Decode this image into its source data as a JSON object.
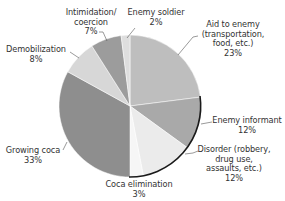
{
  "chart_data": {
    "type": "pie",
    "title": "",
    "start_angle_deg": 0,
    "direction": "clockwise",
    "slices": [
      {
        "label": "Aid to enemy (transportation, food, etc.)",
        "lines": [
          "Aid to enemy",
          "(transportation,",
          "food, etc.)"
        ],
        "value": 23,
        "pct_label": "23%",
        "color": "#bebebe"
      },
      {
        "label": "Enemy informant",
        "lines": [
          "Enemy informant"
        ],
        "value": 12,
        "pct_label": "12%",
        "color": "#a9a9a9"
      },
      {
        "label": "Disorder (robbery, drug use, assaults, etc.)",
        "lines": [
          "Disorder (robbery,",
          "drug use,",
          "assaults, etc.)"
        ],
        "value": 12,
        "pct_label": "12%",
        "color": "#ebebeb"
      },
      {
        "label": "Coca elimination",
        "lines": [
          "Coca elimination"
        ],
        "value": 3,
        "pct_label": "3%",
        "color": "#f6f6f6"
      },
      {
        "label": "Growing coca",
        "lines": [
          "Growing coca"
        ],
        "value": 33,
        "pct_label": "33%",
        "color": "#8e8e8e"
      },
      {
        "label": "Demobilization",
        "lines": [
          "Demobilization"
        ],
        "value": 8,
        "pct_label": "8%",
        "color": "#d7d7d7"
      },
      {
        "label": "Intimidation/ coercion",
        "lines": [
          "Intimidation/",
          "coercion"
        ],
        "value": 7,
        "pct_label": "7%",
        "color": "#9c9c9c"
      },
      {
        "label": "Enemy soldier",
        "lines": [
          "Enemy soldier"
        ],
        "value": 2,
        "pct_label": "2%",
        "color": "#dedede"
      }
    ],
    "legend": "none (direct labels with leader lines)"
  }
}
